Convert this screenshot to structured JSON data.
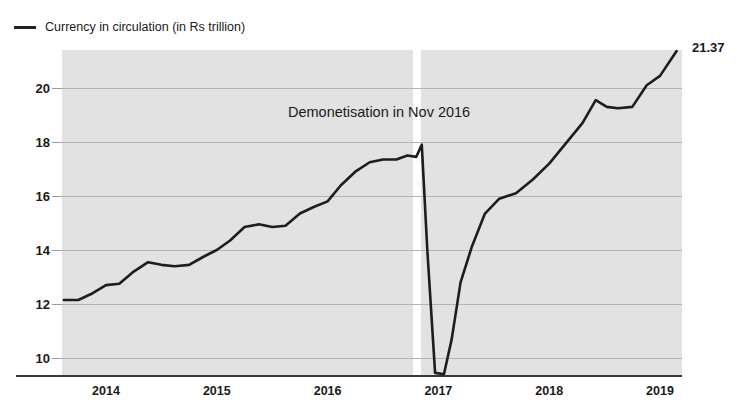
{
  "legend": {
    "swatch_name": "line-swatch",
    "label": "Currency in circulation (in Rs trillion)",
    "color": "#222222"
  },
  "annotation": {
    "text": "Demonetisation in Nov 2016"
  },
  "end_value_label": "21.37",
  "chart_data": {
    "type": "line",
    "title": "",
    "subtitle": "",
    "xlabel": "",
    "ylabel": "",
    "series_name": "Currency in circulation (in Rs trillion)",
    "units": "Rs trillion",
    "line_color": "#1d1d1d",
    "plot_background": "#e2e2e2",
    "page_background": "#ffffff",
    "gridlines": "horizontal",
    "grid_color": "#b4b4b4",
    "legend_position": "top-left",
    "xlim": [
      2013.6,
      2019.2
    ],
    "ylim": [
      9.2,
      21.7
    ],
    "yticks": [
      10,
      12,
      14,
      16,
      18,
      20
    ],
    "xticks": [
      2014,
      2015,
      2016,
      2017,
      2018,
      2019
    ],
    "xtick_labels": [
      "2014",
      "2015",
      "2016",
      "2017",
      "2018",
      "2019"
    ],
    "ytick_labels": [
      "10",
      "12",
      "14",
      "16",
      "18",
      "20"
    ],
    "event_marker": {
      "label": "Demonetisation in Nov 2016",
      "x": 2016.85,
      "style": "white vertical band"
    },
    "final_point": {
      "x": 2019.15,
      "y": 21.37,
      "label": "21.37"
    },
    "x": [
      2013.62,
      2013.75,
      2013.88,
      2014.0,
      2014.12,
      2014.25,
      2014.38,
      2014.5,
      2014.62,
      2014.75,
      2014.88,
      2015.0,
      2015.12,
      2015.25,
      2015.38,
      2015.5,
      2015.62,
      2015.75,
      2015.88,
      2016.0,
      2016.12,
      2016.25,
      2016.38,
      2016.5,
      2016.62,
      2016.72,
      2016.8,
      2016.85,
      2016.9,
      2016.97,
      2017.05,
      2017.12,
      2017.2,
      2017.3,
      2017.42,
      2017.55,
      2017.7,
      2017.85,
      2018.0,
      2018.15,
      2018.3,
      2018.42,
      2018.52,
      2018.62,
      2018.75,
      2018.88,
      2019.0,
      2019.15
    ],
    "y": [
      12.15,
      12.15,
      12.4,
      12.7,
      12.75,
      13.2,
      13.55,
      13.45,
      13.4,
      13.45,
      13.75,
      14.0,
      14.35,
      14.85,
      14.95,
      14.85,
      14.9,
      15.35,
      15.6,
      15.8,
      16.4,
      16.9,
      17.25,
      17.35,
      17.35,
      17.5,
      17.45,
      17.9,
      14.0,
      9.45,
      9.4,
      10.7,
      12.8,
      14.1,
      15.35,
      15.9,
      16.1,
      16.6,
      17.2,
      17.95,
      18.7,
      19.55,
      19.3,
      19.25,
      19.3,
      20.1,
      20.45,
      21.37
    ]
  }
}
